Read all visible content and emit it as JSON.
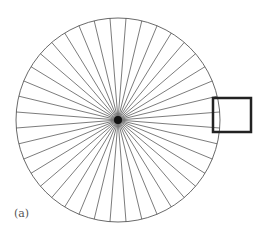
{
  "figure": {
    "label": "(a)",
    "center": [
      118,
      120
    ],
    "radius": 102,
    "spoke_count": 40,
    "stroke_color": "#444444",
    "hub_color": "#111111",
    "inset_box": {
      "x": 213,
      "y": 98,
      "width": 38,
      "height": 34,
      "stroke_color": "#222222"
    }
  }
}
